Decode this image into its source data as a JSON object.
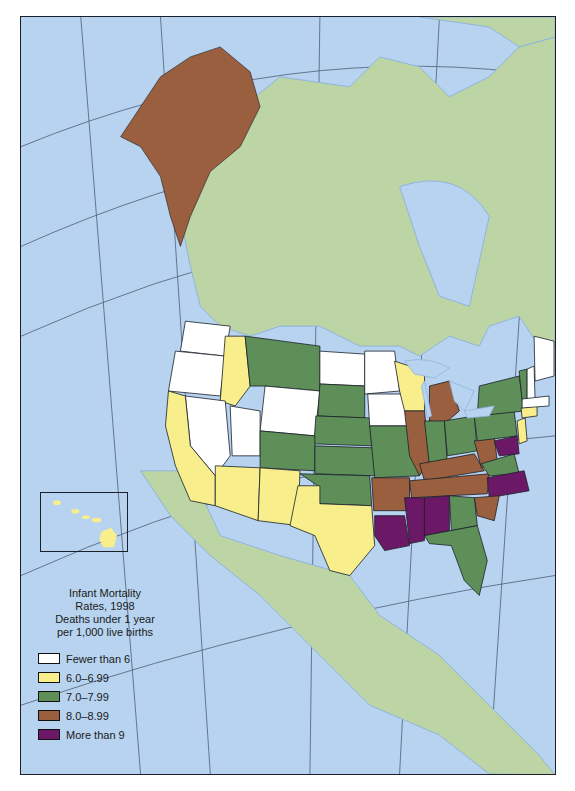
{
  "map": {
    "title_lines": [
      "Infant Mortality",
      "Rates, 1998",
      "Deaths under 1 year",
      "per 1,000 live births"
    ],
    "legend": [
      {
        "key": "lt6",
        "label": "Fewer than 6",
        "color": "#ffffff"
      },
      {
        "key": "6to7",
        "label": "6.0–6.99",
        "color": "#f8ef8c"
      },
      {
        "key": "7to8",
        "label": "7.0–7.99",
        "color": "#5f8f58"
      },
      {
        "key": "8to9",
        "label": "8.0–8.99",
        "color": "#9a5f3e"
      },
      {
        "key": "gt9",
        "label": "More than 9",
        "color": "#6b1866"
      }
    ],
    "colors": {
      "ocean": "#b7d3ef",
      "land_other": "#bdd5a4",
      "borders": "#1b1f2a",
      "graticule": "#3b4a63",
      "rivers": "#8fb4de"
    },
    "states": {
      "lt6": [
        "Washington",
        "Oregon",
        "Nevada",
        "Utah",
        "Wyoming",
        "North Dakota",
        "Minnesota",
        "Iowa",
        "Maine",
        "New Hampshire",
        "Massachusetts"
      ],
      "6to7": [
        "California",
        "Idaho",
        "Arizona",
        "New Mexico",
        "Texas",
        "Wisconsin",
        "Connecticut",
        "Rhode Island",
        "New Jersey",
        "Hawaii"
      ],
      "7to8": [
        "Montana",
        "Colorado",
        "South Dakota",
        "Nebraska",
        "Kansas",
        "Oklahoma",
        "Missouri",
        "Indiana",
        "Ohio",
        "New York",
        "Pennsylvania",
        "Vermont",
        "Virginia",
        "Georgia",
        "Florida"
      ],
      "8to9": [
        "Alaska",
        "Illinois",
        "Michigan",
        "Arkansas",
        "Tennessee",
        "Kentucky",
        "West Virginia",
        "South Carolina"
      ],
      "gt9": [
        "Louisiana",
        "Mississippi",
        "Alabama",
        "North Carolina",
        "Maryland",
        "Delaware"
      ]
    },
    "inset": {
      "label": "Hawaii"
    }
  }
}
